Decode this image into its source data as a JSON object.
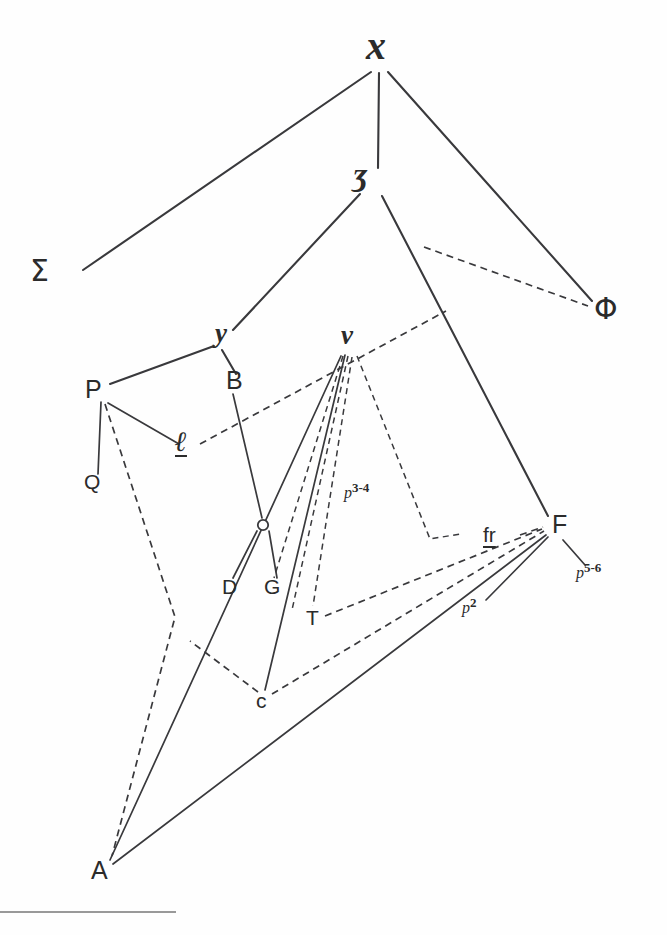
{
  "diagram": {
    "background_color": "#fefefe",
    "ink_color": "#39393c",
    "nodes": [
      {
        "id": "x",
        "label": "x",
        "x": 378,
        "y": 48,
        "style": "script-large"
      },
      {
        "id": "zeta",
        "label": "ʒ",
        "x": 362,
        "y": 180,
        "style": "script-large"
      },
      {
        "id": "sigma",
        "label": "Σ",
        "x": 44,
        "y": 275,
        "style": "greek"
      },
      {
        "id": "phi",
        "label": "Φ",
        "x": 608,
        "y": 315,
        "style": "greek"
      },
      {
        "id": "y",
        "label": "y",
        "x": 224,
        "y": 339,
        "style": "script"
      },
      {
        "id": "v",
        "label": "v",
        "x": 349,
        "y": 341,
        "style": "script"
      },
      {
        "id": "B",
        "label": "B",
        "x": 234,
        "y": 384,
        "style": "roman"
      },
      {
        "id": "P",
        "label": "P",
        "x": 93,
        "y": 394,
        "style": "roman"
      },
      {
        "id": "ell",
        "label": "ℓ",
        "x": 184,
        "y": 448,
        "style": "script-underlined"
      },
      {
        "id": "Q",
        "label": "Q",
        "x": 92,
        "y": 484,
        "style": "roman-sm"
      },
      {
        "id": "F",
        "label": "F",
        "x": 560,
        "y": 528,
        "style": "roman"
      },
      {
        "id": "fr",
        "label": "fr",
        "x": 494,
        "y": 538,
        "style": "roman-underlined"
      },
      {
        "id": "D",
        "label": "D",
        "x": 230,
        "y": 590,
        "style": "roman-sm"
      },
      {
        "id": "G",
        "label": "G",
        "x": 272,
        "y": 590,
        "style": "roman-sm"
      },
      {
        "id": "T",
        "label": "T",
        "x": 313,
        "y": 620,
        "style": "roman-sm"
      },
      {
        "id": "c",
        "label": "c",
        "x": 263,
        "y": 702,
        "style": "roman-sm"
      },
      {
        "id": "A",
        "label": "A",
        "x": 99,
        "y": 875,
        "style": "roman"
      },
      {
        "id": "junction",
        "label": "",
        "x": 263,
        "y": 525,
        "style": "circle"
      }
    ],
    "annotations": [
      {
        "id": "p34",
        "text": "p",
        "sup": "3-4",
        "x": 350,
        "y": 492
      },
      {
        "id": "p56",
        "text": "p",
        "sup": "5-6",
        "x": 582,
        "y": 572
      },
      {
        "id": "p2",
        "text": "p",
        "sup": "2",
        "x": 468,
        "y": 607
      }
    ],
    "edges": [
      {
        "from": "x",
        "to": "sigma",
        "kind": "solid"
      },
      {
        "from": "x",
        "to": "zeta",
        "kind": "solid"
      },
      {
        "from": "x",
        "to": "phi",
        "kind": "solid"
      },
      {
        "from": "zeta",
        "to": "y",
        "kind": "solid"
      },
      {
        "from": "zeta",
        "to": "F",
        "kind": "solid"
      },
      {
        "from": "zeta-branch",
        "to": "phi",
        "kind": "dashed"
      },
      {
        "from": "y",
        "to": "P",
        "kind": "solid"
      },
      {
        "from": "y",
        "to": "B",
        "kind": "solid"
      },
      {
        "from": "B",
        "to": "junction",
        "kind": "solid"
      },
      {
        "from": "P",
        "to": "Q",
        "kind": "solid"
      },
      {
        "from": "P",
        "to": "ell",
        "kind": "solid"
      },
      {
        "from": "P",
        "to": "A",
        "kind": "dashed"
      },
      {
        "from": "ell",
        "to": "v",
        "kind": "dashed"
      },
      {
        "from": "v",
        "to": "c",
        "kind": "solid"
      },
      {
        "from": "v",
        "to": "A",
        "kind": "solid"
      },
      {
        "from": "v",
        "to": "G",
        "kind": "dashed"
      },
      {
        "from": "v",
        "to": "T",
        "kind": "dashed"
      },
      {
        "from": "v",
        "to": "fr",
        "kind": "dashed"
      },
      {
        "from": "junction",
        "to": "D",
        "kind": "solid"
      },
      {
        "from": "junction",
        "to": "G",
        "kind": "solid"
      },
      {
        "from": "T",
        "to": "F",
        "kind": "dashed"
      },
      {
        "from": "c",
        "to": "F",
        "kind": "dashed"
      },
      {
        "from": "c",
        "to": "A",
        "kind": "dashed"
      },
      {
        "from": "A",
        "to": "F",
        "kind": "solid"
      },
      {
        "from": "F",
        "to": "p56",
        "kind": "solid"
      },
      {
        "from": "F",
        "to": "p2",
        "kind": "solid"
      }
    ],
    "footnote_rule": {
      "x1": 0,
      "x2": 176,
      "y": 912
    }
  }
}
